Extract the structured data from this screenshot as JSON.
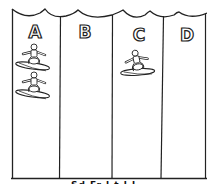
{
  "diagram": {
    "lanes": [
      {
        "label": "A",
        "surfer_count": 2
      },
      {
        "label": "B",
        "surfer_count": 0
      },
      {
        "label": "C",
        "surfer_count": 1
      },
      {
        "label": "D",
        "surfer_count": 0
      }
    ],
    "caption_partial": "Sd  Fr  l  t  l l",
    "colors": {
      "line": "#222222",
      "background": "#ffffff"
    }
  }
}
